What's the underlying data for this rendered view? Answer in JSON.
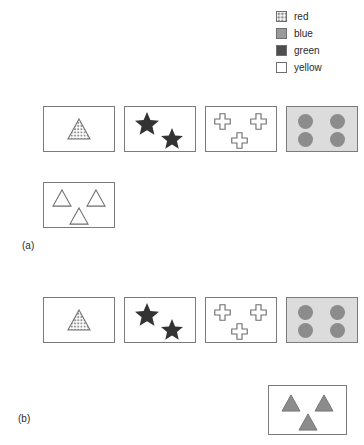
{
  "legend": {
    "items": [
      {
        "label": "red",
        "swatch": "red-swatch-checkered",
        "color": "#8f8f8f"
      },
      {
        "label": "blue",
        "swatch": "blue-swatch-solid",
        "color": "#9a9a9a"
      },
      {
        "label": "green",
        "swatch": "green-swatch-solid",
        "color": "#4d4d4d"
      },
      {
        "label": "yellow",
        "swatch": "yellow-swatch-empty",
        "color": "#ffffff"
      }
    ]
  },
  "panels": [
    {
      "label": "(a)",
      "boxes": [
        {
          "name": "box-a-1",
          "shape": "triangle",
          "color": "red",
          "count": 1,
          "tinted": false
        },
        {
          "name": "box-a-2",
          "shape": "star",
          "color": "green",
          "count": 2,
          "tinted": false
        },
        {
          "name": "box-a-3",
          "shape": "cross",
          "color": "yellow",
          "count": 3,
          "tinted": false
        },
        {
          "name": "box-a-4",
          "shape": "circle",
          "color": "blue",
          "count": 4,
          "tinted": true
        },
        {
          "name": "box-a-5",
          "shape": "triangle",
          "color": "yellow",
          "count": 3,
          "tinted": false
        }
      ]
    },
    {
      "label": "(b)",
      "boxes": [
        {
          "name": "box-b-1",
          "shape": "triangle",
          "color": "red",
          "count": 1,
          "tinted": false
        },
        {
          "name": "box-b-2",
          "shape": "star",
          "color": "green",
          "count": 2,
          "tinted": false
        },
        {
          "name": "box-b-3",
          "shape": "cross",
          "color": "yellow",
          "count": 3,
          "tinted": false
        },
        {
          "name": "box-b-4",
          "shape": "circle",
          "color": "blue",
          "count": 4,
          "tinted": true
        },
        {
          "name": "box-b-5",
          "shape": "triangle",
          "color": "blue",
          "count": 3,
          "tinted": false
        }
      ]
    }
  ]
}
